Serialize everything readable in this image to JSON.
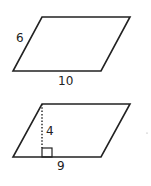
{
  "figures": [
    {
      "type": "parallelogram",
      "side_label": "6",
      "base_label": "10"
    },
    {
      "type": "parallelogram",
      "height_label": "4",
      "base_label": "9",
      "height_style": "dotted",
      "right_angle_marker": true
    }
  ],
  "colors": {
    "stroke": "#222222",
    "background": "#ffffff"
  }
}
